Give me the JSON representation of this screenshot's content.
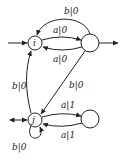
{
  "diagram": {
    "type": "finite-state-transducer",
    "colors": {
      "stroke": "#222222",
      "background": "#ffffff"
    },
    "nodes": [
      {
        "id": "i",
        "label": "i"
      },
      {
        "id": "q1",
        "label": ""
      },
      {
        "id": "j",
        "label": "j"
      },
      {
        "id": "q2",
        "label": ""
      }
    ],
    "edges": [
      {
        "from": "q1",
        "to": "i",
        "label": "b|0",
        "position": "top arc"
      },
      {
        "from": "i",
        "to": "q1",
        "label": "a|0",
        "position": "upper straight"
      },
      {
        "from": "q1",
        "to": "i",
        "label": "a|0",
        "position": "lower straight"
      },
      {
        "from": "j",
        "to": "i",
        "label": "b|0",
        "position": "left curve"
      },
      {
        "from": "q1",
        "to": "j",
        "label": "b|0",
        "position": "diagonal"
      },
      {
        "from": "j",
        "to": "q2",
        "label": "a|1",
        "position": "upper"
      },
      {
        "from": "q2",
        "to": "j",
        "label": "a|1",
        "position": "lower"
      },
      {
        "from": "j",
        "to": "j",
        "label": "b|0",
        "position": "self-loop below"
      }
    ],
    "labels": {
      "node_i": "i",
      "node_j": "j",
      "edge_top_arc": "b|0",
      "edge_i_to_q1": "a|0",
      "edge_q1_to_i": "a|0",
      "edge_j_to_i": "b|0",
      "edge_q1_to_j": "b|0",
      "edge_j_to_q2": "a|1",
      "edge_q2_to_j": "a|1",
      "edge_j_loop": "b|0"
    }
  }
}
